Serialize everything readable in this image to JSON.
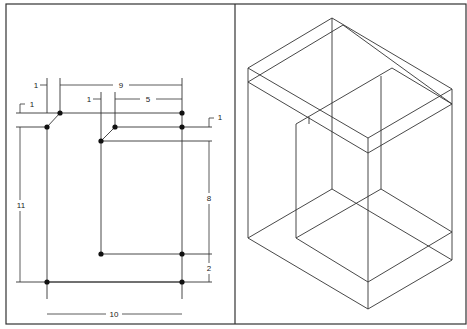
{
  "figure": {
    "frame": {
      "x": 6,
      "y": 4,
      "width": 460,
      "height": 320,
      "divider_x": 235,
      "stroke": "#333333"
    },
    "left_panel": {
      "name": "orthographic-top-view",
      "dimension_labels": {
        "dim_1_left_horizontal": "1",
        "dim_9": "9",
        "dim_1_inner_horizontal": "1",
        "dim_5": "5",
        "dim_1_left_vertical": "1",
        "dim_1_right_vertical": "1",
        "dim_11": "11",
        "dim_8": "8",
        "dim_2": "2",
        "dim_10": "10"
      },
      "points": [
        [
          60,
          113
        ],
        [
          182,
          113
        ],
        [
          47,
          127
        ],
        [
          115,
          127
        ],
        [
          182,
          127
        ],
        [
          101,
          141
        ],
        [
          101,
          254
        ],
        [
          182,
          254
        ],
        [
          47,
          282
        ],
        [
          182,
          282
        ]
      ],
      "lines": [
        [
          60,
          113,
          182,
          113
        ],
        [
          47,
          127,
          60,
          113
        ],
        [
          47,
          127,
          47,
          282
        ],
        [
          47,
          282,
          182,
          282
        ],
        [
          182,
          113,
          182,
          282
        ],
        [
          115,
          127,
          182,
          127
        ],
        [
          101,
          141,
          115,
          127
        ],
        [
          101,
          141,
          101,
          254
        ],
        [
          101,
          254,
          182,
          254
        ],
        [
          16,
          113,
          60,
          113
        ],
        [
          16,
          127,
          47,
          127
        ],
        [
          182,
          127,
          212,
          127
        ],
        [
          101,
          141,
          212,
          141
        ],
        [
          182,
          254,
          212,
          254
        ],
        [
          16,
          282,
          212,
          282
        ],
        [
          47,
          78,
          47,
          113
        ],
        [
          60,
          78,
          60,
          113
        ],
        [
          182,
          78,
          182,
          113
        ],
        [
          101,
          92,
          101,
          141
        ],
        [
          115,
          92,
          115,
          127
        ],
        [
          47,
          282,
          47,
          299
        ],
        [
          182,
          282,
          182,
          299
        ]
      ],
      "dimension_lines": [
        {
          "x1": 60,
          "y1": 85,
          "x2": 182,
          "y2": 85,
          "label": "dim_9",
          "lx": 121,
          "ly": 88
        },
        {
          "x1": 115,
          "y1": 99,
          "x2": 182,
          "y2": 99,
          "label": "dim_5",
          "lx": 148,
          "ly": 102
        },
        {
          "x1": 47,
          "y1": 314,
          "x2": 182,
          "y2": 314,
          "label": "dim_10",
          "lx": 114,
          "ly": 317
        },
        {
          "x1": 20,
          "y1": 127,
          "x2": 20,
          "y2": 282,
          "label": "dim_11",
          "lx": 21,
          "ly": 208
        },
        {
          "x1": 209,
          "y1": 141,
          "x2": 209,
          "y2": 254,
          "label": "dim_8",
          "lx": 209,
          "ly": 201
        },
        {
          "x1": 209,
          "y1": 254,
          "x2": 209,
          "y2": 282,
          "label": "dim_2",
          "lx": 209,
          "ly": 271
        }
      ]
    },
    "right_panel": {
      "name": "isometric-view",
      "edges": [
        [
          248,
          68,
          332,
          18
        ],
        [
          332,
          18,
          452,
          89
        ],
        [
          248,
          68,
          368,
          138
        ],
        [
          368,
          138,
          452,
          89
        ],
        [
          248,
          82,
          343,
          25
        ],
        [
          343,
          25,
          452,
          104
        ],
        [
          248,
          82,
          368,
          153
        ],
        [
          368,
          153,
          452,
          104
        ],
        [
          248,
          68,
          248,
          238
        ],
        [
          452,
          89,
          452,
          260
        ],
        [
          368,
          138,
          368,
          309
        ],
        [
          332,
          18,
          332,
          189
        ],
        [
          296,
          124,
          392,
          68
        ],
        [
          392,
          68,
          452,
          104
        ],
        [
          296,
          124,
          296,
          238
        ],
        [
          309,
          117,
          309,
          124
        ],
        [
          381,
          76,
          381,
          189
        ],
        [
          248,
          238,
          332,
          189
        ],
        [
          332,
          189,
          452,
          260
        ],
        [
          248,
          238,
          368,
          309
        ],
        [
          368,
          309,
          452,
          260
        ],
        [
          296,
          238,
          381,
          189
        ],
        [
          381,
          189,
          452,
          232
        ],
        [
          296,
          238,
          368,
          282
        ],
        [
          368,
          282,
          452,
          232
        ]
      ]
    }
  }
}
